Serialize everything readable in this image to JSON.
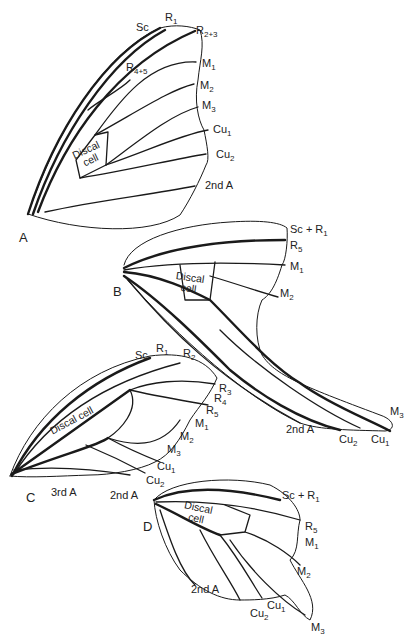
{
  "figure": {
    "panels": [
      {
        "id": "A",
        "cell_label": "Discal cell",
        "veins": [
          "Sc",
          "R1",
          "R2+3",
          "R4+5",
          "M1",
          "M2",
          "M3",
          "Cu1",
          "Cu2",
          "2nd A"
        ]
      },
      {
        "id": "B",
        "cell_label": "Discal cell",
        "veins": [
          "Sc+R1",
          "R5",
          "M1",
          "M2",
          "M3",
          "Cu1",
          "Cu2",
          "2nd A"
        ]
      },
      {
        "id": "C",
        "cell_label": "Discal cell",
        "veins": [
          "Sc",
          "R1",
          "R2",
          "R3",
          "R4",
          "R5",
          "M1",
          "M2",
          "M3",
          "Cu1",
          "Cu2",
          "2nd A",
          "3rd A"
        ]
      },
      {
        "id": "D",
        "cell_label": "Discal cell",
        "veins": [
          "Sc+R1",
          "R5",
          "M1",
          "M2",
          "M3",
          "Cu1",
          "Cu2",
          "2nd A"
        ]
      }
    ]
  },
  "labels": {
    "A": {
      "panel": "A",
      "cell_1": "Discal",
      "cell_2": "cell",
      "Sc": "Sc",
      "R1_b": "R",
      "R1_s": "1",
      "R23_b": "R",
      "R23_s": "2+3",
      "R45_b": "R",
      "R45_s": "4+5",
      "M1_b": "M",
      "M1_s": "1",
      "M2_b": "M",
      "M2_s": "2",
      "M3_b": "M",
      "M3_s": "3",
      "Cu1_b": "Cu",
      "Cu1_s": "1",
      "Cu2_b": "Cu",
      "Cu2_s": "2",
      "A2": "2nd A"
    },
    "B": {
      "panel": "B",
      "cell_1": "Discal",
      "cell_2": "cell",
      "ScR1_b": "Sc + R",
      "ScR1_s": "1",
      "R5_b": "R",
      "R5_s": "5",
      "M1_b": "M",
      "M1_s": "1",
      "M2_b": "M",
      "M2_s": "2",
      "M3_b": "M",
      "M3_s": "3",
      "Cu1_b": "Cu",
      "Cu1_s": "1",
      "Cu2_b": "Cu",
      "Cu2_s": "2",
      "A2": "2nd A"
    },
    "C": {
      "panel": "C",
      "cell": "Discal cell",
      "Sc": "Sc",
      "R1_b": "R",
      "R1_s": "1",
      "R2_b": "R",
      "R2_s": "2",
      "R3_b": "R",
      "R3_s": "3",
      "R4_b": "R",
      "R4_s": "4",
      "R5_b": "R",
      "R5_s": "5",
      "M1_b": "M",
      "M1_s": "1",
      "M2_b": "M",
      "M2_s": "2",
      "M3_b": "M",
      "M3_s": "3",
      "Cu1_b": "Cu",
      "Cu1_s": "1",
      "Cu2_b": "Cu",
      "Cu2_s": "2",
      "A2": "2nd A",
      "A3": "3rd A"
    },
    "D": {
      "panel": "D",
      "cell_1": "Discal",
      "cell_2": "cell",
      "ScR1_b": "Sc + R",
      "ScR1_s": "1",
      "R5_b": "R",
      "R5_s": "5",
      "M1_b": "M",
      "M1_s": "1",
      "M2_b": "M",
      "M2_s": "2",
      "M3_b": "M",
      "M3_s": "3",
      "Cu1_b": "Cu",
      "Cu1_s": "1",
      "Cu2_b": "Cu",
      "Cu2_s": "2",
      "A2": "2nd A"
    }
  }
}
